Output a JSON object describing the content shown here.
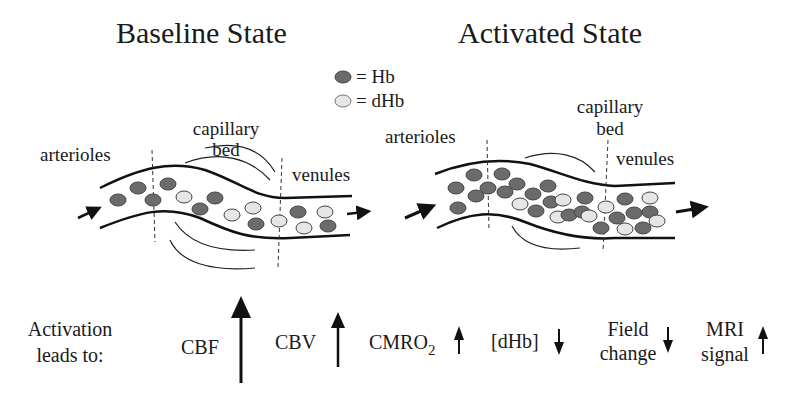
{
  "titles": {
    "baseline": "Baseline State",
    "activated": "Activated State"
  },
  "legend": {
    "hb": "= Hb",
    "dhb": "= dHb",
    "hb_color": "#6b6b6b",
    "dhb_color": "#e6e6e6"
  },
  "baseline": {
    "arterioles": "arterioles",
    "capillary": "capillary",
    "bed": "bed",
    "venules": "venules"
  },
  "activated": {
    "arterioles": "arterioles",
    "capillary": "capillary",
    "bed": "bed",
    "venules": "venules"
  },
  "bottom": {
    "activation_line1": "Activation",
    "activation_line2": "leads to:",
    "cbf": "CBF",
    "cbf_direction": "up (large)",
    "cbv": "CBV",
    "cbv_direction": "up",
    "cmro2": "CMRO",
    "cmro2_sub": "2",
    "cmro2_direction": "up (small)",
    "dhb": "[dHb]",
    "dhb_direction": "down",
    "field_line1": "Field",
    "field_line2": "change",
    "field_direction": "down",
    "mri_line1": "MRI",
    "mri_line2": "signal",
    "mri_direction": "up"
  }
}
